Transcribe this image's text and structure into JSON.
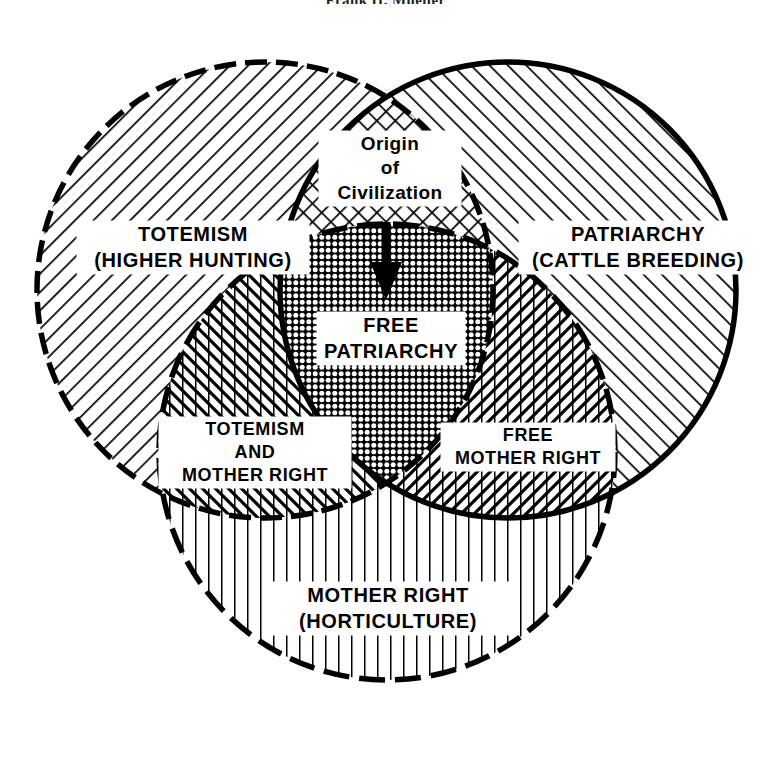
{
  "page": {
    "running_head": "Frank H. Mueller",
    "background_color": "#ffffff",
    "ink_color": "#000000"
  },
  "diagram": {
    "type": "three-circle-venn",
    "circles": [
      {
        "id": "totemism",
        "label_line1": "TOTEMISM",
        "label_line2": "(HIGHER HUNTING)",
        "hatch": "backslash-diagonal",
        "outline": "dashed",
        "cx": 265,
        "cy": 290,
        "r": 228
      },
      {
        "id": "patriarchy",
        "label_line1": "PATRIARCHY",
        "label_line2": "(CATTLE BREEDING)",
        "hatch": "forwardslash-diagonal",
        "outline": "solid",
        "cx": 508,
        "cy": 290,
        "r": 228
      },
      {
        "id": "mother-right",
        "label_line1": "MOTHER RIGHT",
        "label_line2": "(HORTICULTURE)",
        "hatch": "vertical-lines",
        "outline": "dashed",
        "cx": 387,
        "cy": 452,
        "r": 228
      }
    ],
    "intersections": [
      {
        "id": "origin-of-civilization",
        "region": "totemism + patriarchy",
        "label_line1": "Origin",
        "label_line2": "of",
        "label_line3": "Civilization",
        "hatch": "cross-hatch-diamond"
      },
      {
        "id": "free-patriarchy",
        "region": "totemism + patriarchy + mother-right",
        "label_line1": "FREE",
        "label_line2": "PATRIARCHY",
        "hatch": "triple-cross-hatch-dense"
      },
      {
        "id": "totemism-and-mother-right",
        "region": "totemism + mother-right",
        "label_line1": "TOTEMISM",
        "label_line2": "AND",
        "label_line3": "MOTHER RIGHT",
        "hatch": "backslash-plus-vertical"
      },
      {
        "id": "free-mother-right",
        "region": "patriarchy + mother-right",
        "label_line1": "FREE",
        "label_line2": "MOTHER RIGHT",
        "hatch": "forwardslash-plus-vertical"
      }
    ],
    "annotations": [
      {
        "id": "origin-arrow",
        "kind": "down-arrow",
        "meaning": "Origin of Civilization leads to Free Patriarchy"
      }
    ]
  }
}
